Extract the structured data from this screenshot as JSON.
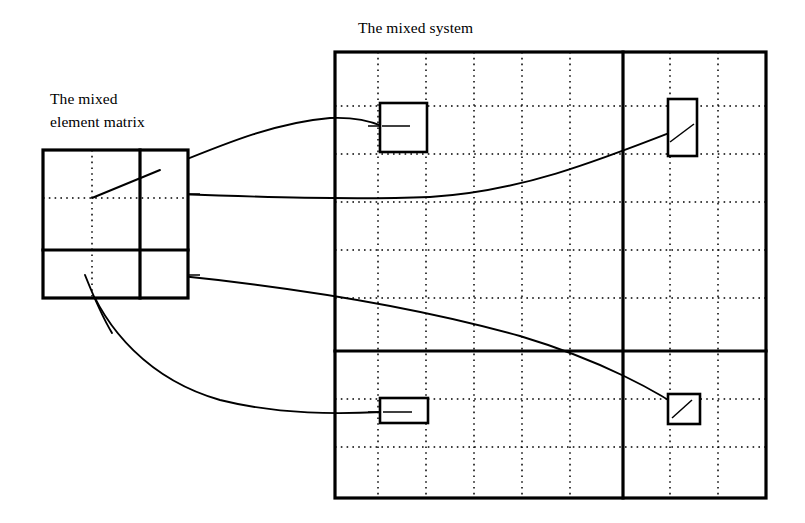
{
  "figure": {
    "background_color": "#ffffff",
    "line_color": "#000000",
    "width": 805,
    "height": 523
  },
  "labels": {
    "system_title": "The mixed system",
    "matrix_title_line1": "The mixed",
    "matrix_title_line2": "element matrix"
  },
  "matrix": {
    "name": "mixed-element-matrix",
    "x": 43,
    "y": 150,
    "width": 145,
    "height": 148,
    "divider_vertical_x": 140,
    "divider_horizontal_y": 250,
    "dotted_vertical_x": 92,
    "dotted_horizontal_y": 198,
    "rows": 2,
    "cols": 2
  },
  "system": {
    "name": "mixed-system-grid",
    "x": 335,
    "y": 52,
    "width": 431,
    "height": 446,
    "thick_vertical_x": 623,
    "thick_horizontal_y": 351,
    "dotted_vertical_x": [
      378,
      426,
      474,
      522,
      570,
      670,
      718
    ],
    "dotted_horizontal_y": [
      106,
      154,
      202,
      250,
      298,
      399,
      447
    ],
    "elements": [
      {
        "name": "element-top-left",
        "x": 380,
        "y": 103,
        "width": 47,
        "height": 49
      },
      {
        "name": "element-top-right",
        "x": 668,
        "y": 99,
        "width": 29,
        "height": 57
      },
      {
        "name": "element-bottom-left",
        "x": 380,
        "y": 398,
        "width": 48,
        "height": 25
      },
      {
        "name": "element-bottom-right",
        "x": 668,
        "y": 394,
        "width": 32,
        "height": 30
      }
    ]
  },
  "connectors": [
    {
      "name": "connector-to-top-left",
      "path": "M 92 198 L 155 172 C 215 148 270 123 330 118 C 352 117 368 120 382 126",
      "from": "matrix-center",
      "to": "element-top-left"
    },
    {
      "name": "connector-to-top-right",
      "path": "M 176 194 C 260 197 350 200 430 197 C 520 192 600 160 682 128",
      "from": "matrix-upper-right-cell",
      "to": "element-top-right"
    },
    {
      "name": "connector-to-bottom-right",
      "path": "M 172 275 C 300 288 420 308 520 336 C 600 360 660 392 692 416",
      "from": "matrix-lower-right-cell",
      "to": "element-bottom-right"
    },
    {
      "name": "connector-to-bottom-left",
      "path": "M 85 275 C 105 330 150 380 220 400 C 280 415 340 414 382 412",
      "from": "matrix-lower-left-cell",
      "to": "element-bottom-left"
    }
  ],
  "connector_stubs": [
    {
      "name": "stub-top-left-element",
      "x1": 368,
      "y1": 126,
      "x2": 410,
      "y2": 126
    },
    {
      "name": "stub-matrix-upper-right",
      "x1": 172,
      "y1": 194,
      "x2": 196,
      "y2": 194
    },
    {
      "name": "stub-matrix-lower-right",
      "x1": 168,
      "y1": 275,
      "x2": 196,
      "y2": 275
    },
    {
      "name": "stub-bottom-left-element",
      "x1": 368,
      "y1": 412,
      "x2": 412,
      "y2": 412
    }
  ]
}
